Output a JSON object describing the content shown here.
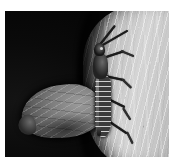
{
  "image": {
    "kind": "macro-nature-photograph",
    "title": "Predatory bug and moth on bark",
    "orientation": "portrait",
    "width_px": 174,
    "height_px": 162,
    "border": {
      "color": "#ffffff",
      "top_px": 11,
      "left_px": 5,
      "right_px": 5,
      "bottom_px": 5
    },
    "caption": ""
  },
  "scene": {
    "background": {
      "label": "black background",
      "color": "#050505",
      "region": "left and lower-left"
    },
    "substrate": {
      "label": "pale textured tree bark",
      "color_light": "#d6d6d6",
      "color_mid": "#b0b0b0",
      "color_dark": "#6e6e6e",
      "texture": "diagonal vertical striations",
      "region": "right side, curved left margin"
    },
    "subjects": [
      {
        "name": "predatory-bug",
        "label": "assassin bug",
        "color": "#1c1c1c",
        "position": "center-right, vertical on bark edge",
        "parts": [
          "head",
          "antennae",
          "thorax",
          "banded abdomen",
          "legs",
          "rostrum"
        ]
      },
      {
        "name": "moth",
        "label": "moth with folded grey wing",
        "color": "#7e7e7e",
        "position": "lower-left, against black background",
        "parts": [
          "forewing",
          "wing veins",
          "wing tip"
        ]
      }
    ]
  }
}
